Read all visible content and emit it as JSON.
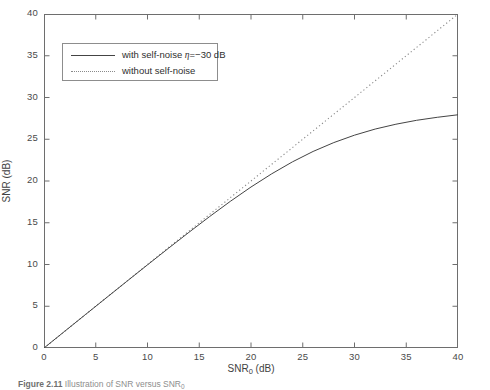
{
  "chart_data": {
    "type": "line",
    "title": "",
    "xlabel": "SNR_0 (dB)",
    "xlabel_base": "SNR",
    "xlabel_sub": "0",
    "xlabel_unit": " (dB)",
    "ylabel": "SNR (dB)",
    "xlim": [
      0,
      40
    ],
    "ylim": [
      0,
      40
    ],
    "xticks": [
      0,
      5,
      10,
      15,
      20,
      25,
      30,
      35,
      40
    ],
    "yticks": [
      0,
      5,
      10,
      15,
      20,
      25,
      30,
      35,
      40
    ],
    "grid": false,
    "legend_position": "upper left",
    "line_color": "#444444",
    "dotted_color": "#8a8a8a",
    "axis_color": "#6e6e6e",
    "series": [
      {
        "name": "with self-noise η=−30 dB",
        "style": "solid",
        "x": [
          0,
          2,
          4,
          6,
          8,
          10,
          12,
          14,
          16,
          18,
          20,
          22,
          24,
          26,
          28,
          30,
          32,
          34,
          36,
          38,
          40
        ],
        "values": [
          0.0,
          2.0,
          4.0,
          5.99,
          7.98,
          9.96,
          11.92,
          13.85,
          15.74,
          17.56,
          19.28,
          20.86,
          22.29,
          23.54,
          24.6,
          25.49,
          26.22,
          26.8,
          27.27,
          27.63,
          27.93
        ]
      },
      {
        "name": "without self-noise",
        "style": "dotted",
        "x": [
          0,
          40
        ],
        "values": [
          0,
          40
        ]
      }
    ]
  },
  "legend": {
    "entries": [
      {
        "label_prefix": "with self-noise ",
        "eta": "η",
        "label_suffix": "=−30 dB",
        "style": "solid"
      },
      {
        "label_prefix": "without self-noise",
        "eta": "",
        "label_suffix": "",
        "style": "dotted"
      }
    ]
  },
  "caption": {
    "figure_number": "Figure 2.11",
    "text": "Illustration of SNR versus SNR",
    "subscript": "0"
  }
}
